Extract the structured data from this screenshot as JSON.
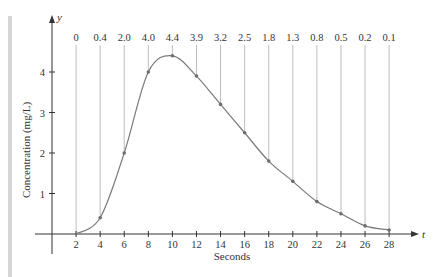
{
  "chart_data": {
    "type": "line",
    "title": "",
    "xlabel": "Seconds",
    "ylabel": "Concentration (mg/L)",
    "x_axis_symbol": "t",
    "y_axis_symbol": "y",
    "x": [
      0,
      2,
      4,
      6,
      8,
      10,
      12,
      14,
      16,
      18,
      20,
      22,
      24,
      26,
      28
    ],
    "x_ticks": [
      2,
      4,
      6,
      8,
      10,
      12,
      14,
      16,
      18,
      20,
      22,
      24,
      26,
      28
    ],
    "y_ticks": [
      1,
      2,
      3,
      4
    ],
    "xlim": [
      0,
      30
    ],
    "ylim": [
      0,
      4.8
    ],
    "grid": false,
    "legend": null,
    "series": [
      {
        "name": "Concentration",
        "x": [
          2,
          4,
          6,
          8,
          10,
          12,
          14,
          16,
          18,
          20,
          22,
          24,
          26,
          28
        ],
        "values": [
          0,
          0.4,
          2.0,
          4.0,
          4.4,
          3.9,
          3.2,
          2.5,
          1.8,
          1.3,
          0.8,
          0.5,
          0.2,
          0.1
        ]
      }
    ],
    "annotations": {
      "top_value_labels": [
        "0",
        "0.4",
        "2.0",
        "4.0",
        "4.4",
        "3.9",
        "3.2",
        "2.5",
        "1.8",
        "1.3",
        "0.8",
        "0.5",
        "0.2",
        "0.1"
      ],
      "vertical_reference_lines_at_x": [
        2,
        4,
        6,
        8,
        10,
        12,
        14,
        16,
        18,
        20,
        22,
        24,
        26,
        28
      ]
    }
  },
  "colors": {
    "axis": "#333333",
    "curve": "#7a7a7a",
    "reference_lines": "#bdbdbd",
    "points": "#6e6e6e",
    "side_bar": "#d6d6d6"
  }
}
